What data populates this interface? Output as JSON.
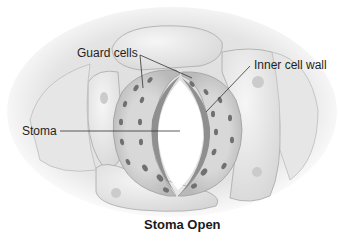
{
  "diagram": {
    "title": "Stoma Open",
    "labels": {
      "guard_cells": "Guard cells",
      "inner_cell_wall": "Inner cell wall",
      "stoma": "Stoma"
    }
  },
  "colors": {
    "background": "#ffffff",
    "epidermal_cell": "#e8e8e8",
    "guard_cell": "#c9c9c9",
    "inner_wall": "#9a9a9a",
    "chloroplast": "#6f6f6f",
    "pore": "#ffffff",
    "leader_line": "#333333",
    "text": "#1f1f1f"
  }
}
